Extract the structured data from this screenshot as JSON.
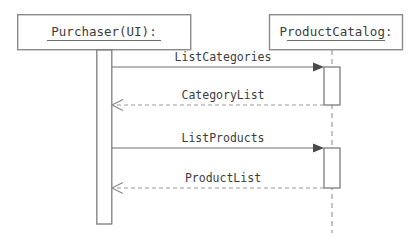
{
  "diagram": {
    "type": "uml-sequence-diagram",
    "title": "",
    "background_color": "#ffffff",
    "line_color": "#8a8a8a",
    "text_color": "#3c3c3c",
    "participants": [
      {
        "id": "purchaser",
        "label": "Purchaser(UI):",
        "underlined": true,
        "box": {
          "x": 17,
          "y": 14,
          "width": 174,
          "height": 36
        },
        "lifeline_x": 104,
        "lifeline_style": "solid",
        "activations": [
          {
            "x": 97,
            "y": 50,
            "width": 15,
            "height": 174
          }
        ]
      },
      {
        "id": "productcatalog",
        "label": "ProductCatalog:",
        "underlined": true,
        "box": {
          "x": 269,
          "y": 14,
          "width": 134,
          "height": 36
        },
        "lifeline_x": 332,
        "lifeline_style": "dashed",
        "activations": [
          {
            "x": 324,
            "y": 67,
            "width": 16,
            "height": 38
          },
          {
            "x": 324,
            "y": 148,
            "width": 16,
            "height": 40
          }
        ]
      }
    ],
    "messages": [
      {
        "index": 1,
        "label": "ListCategories",
        "kind": "call",
        "line_style": "solid",
        "arrowhead": "filled",
        "direction": "left-to-right",
        "from": "purchaser",
        "to": "productcatalog",
        "x_start": 112,
        "x_end": 324,
        "y": 67,
        "label_x": 223,
        "label_y": 57
      },
      {
        "index": 2,
        "label": "CategoryList",
        "kind": "return",
        "line_style": "dashed",
        "arrowhead": "open",
        "direction": "right-to-left",
        "from": "productcatalog",
        "to": "purchaser",
        "x_start": 324,
        "x_end": 112,
        "y": 105,
        "label_x": 223,
        "label_y": 95
      },
      {
        "index": 3,
        "label": "ListProducts",
        "kind": "call",
        "line_style": "solid",
        "arrowhead": "filled",
        "direction": "left-to-right",
        "from": "purchaser",
        "to": "productcatalog",
        "x_start": 112,
        "x_end": 324,
        "y": 148,
        "label_x": 223,
        "label_y": 138
      },
      {
        "index": 4,
        "label": "ProductList",
        "kind": "return",
        "line_style": "dashed",
        "arrowhead": "open",
        "direction": "right-to-left",
        "from": "productcatalog",
        "to": "purchaser",
        "x_start": 324,
        "x_end": 112,
        "y": 188,
        "label_x": 223,
        "label_y": 178
      }
    ]
  }
}
